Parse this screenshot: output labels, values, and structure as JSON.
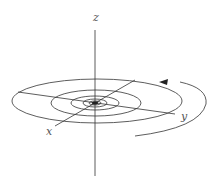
{
  "diagram": {
    "type": "3d-spiral",
    "axes": {
      "z_label": "z",
      "x_label": "x",
      "y_label": "y"
    },
    "direction": "counterclockwise-inward",
    "colors": {
      "line": "#333333",
      "label": "#555555",
      "background": "#ffffff"
    }
  }
}
